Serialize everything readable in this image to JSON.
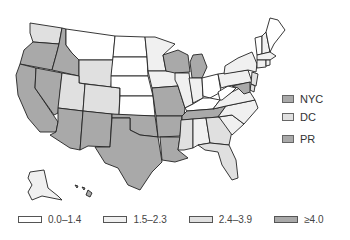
{
  "map": {
    "title": "",
    "classes": [
      {
        "label": "0.0–1.4",
        "color": "#ffffff"
      },
      {
        "label": "1.5–2.3",
        "color": "#f0f0f0"
      },
      {
        "label": "2.4–3.9",
        "color": "#e0e0e0"
      },
      {
        "label": "≥4.0",
        "color": "#a9a9a9"
      }
    ],
    "insets": [
      {
        "label": "NYC",
        "class": 3
      },
      {
        "label": "DC",
        "class": 2
      },
      {
        "label": "PR",
        "class": 3
      }
    ],
    "states": {
      "WA": 2,
      "OR": 3,
      "CA": 3,
      "NV": 3,
      "ID": 3,
      "MT": 0,
      "WY": 2,
      "UT": 2,
      "CO": 2,
      "AZ": 3,
      "NM": 3,
      "ND": 0,
      "SD": 0,
      "NE": 0,
      "KS": 0,
      "OK": 3,
      "TX": 3,
      "MN": 1,
      "IA": 1,
      "MO": 3,
      "AR": 3,
      "LA": 3,
      "WI": 3,
      "IL": 1,
      "MI": 3,
      "IN": 1,
      "OH": 0,
      "KY": 0,
      "TN": 3,
      "MS": 2,
      "AL": 1,
      "GA": 2,
      "FL": 2,
      "SC": 1,
      "NC": 1,
      "VA": 1,
      "WV": 0,
      "PA": 1,
      "NY": 1,
      "VT": 0,
      "NH": 1,
      "ME": 0,
      "MA": 1,
      "CT": 1,
      "RI": 1,
      "NJ": 2,
      "DE": 2,
      "MD": 3,
      "AK": 1,
      "HI": 3
    }
  }
}
